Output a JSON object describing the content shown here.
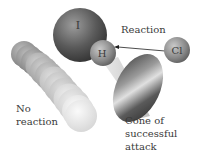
{
  "diagram": {
    "type": "molecular-collision",
    "atoms": {
      "iodine": {
        "symbol": "I"
      },
      "hydrogen": {
        "symbol": "H"
      },
      "chlorine": {
        "symbol": "Cl"
      }
    },
    "labels": {
      "reaction": "Reaction",
      "no_reaction_line1": "No",
      "no_reaction_line2": "reaction",
      "cone_line1": "Cone of",
      "cone_line2": "successful",
      "cone_line3": "attack"
    },
    "colors": {
      "background": "#ffffff",
      "iodine_dark": "#3c3c3c",
      "iodine_light": "#b0b0b0",
      "small_atom_dark": "#6e6e6e",
      "small_atom_light": "#c8c8c8",
      "cone_dark": "#2e2e2e",
      "cone_light": "#e4e4e4",
      "text": "#3a3a3a"
    }
  }
}
